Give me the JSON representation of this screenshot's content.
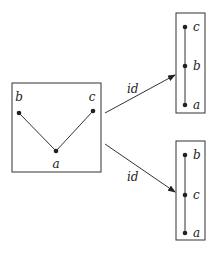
{
  "diagram": {
    "source_poset": {
      "nodes": [
        {
          "id": "b",
          "label": "b",
          "x": 19,
          "y": 113,
          "lx": 19,
          "ly": 101
        },
        {
          "id": "c",
          "label": "c",
          "x": 93,
          "y": 111,
          "lx": 92,
          "ly": 101
        },
        {
          "id": "a",
          "label": "a",
          "x": 56,
          "y": 151,
          "lx": 56,
          "ly": 168
        }
      ],
      "edges": [
        [
          "b",
          "a"
        ],
        [
          "c",
          "a"
        ]
      ]
    },
    "arrows": [
      {
        "label": "id",
        "from": [
          105,
          113
        ],
        "to": [
          176,
          75
        ],
        "lx": 127,
        "ly": 93
      },
      {
        "label": "id",
        "from": [
          105,
          144
        ],
        "to": [
          176,
          192
        ],
        "lx": 127,
        "ly": 181
      }
    ],
    "top_chain": {
      "nodes": [
        {
          "label": "c",
          "y": 27
        },
        {
          "label": "b",
          "y": 66
        },
        {
          "label": "a",
          "y": 105
        }
      ]
    },
    "bottom_chain": {
      "nodes": [
        {
          "label": "b",
          "y": 155
        },
        {
          "label": "c",
          "y": 195
        },
        {
          "label": "a",
          "y": 233
        }
      ]
    }
  }
}
